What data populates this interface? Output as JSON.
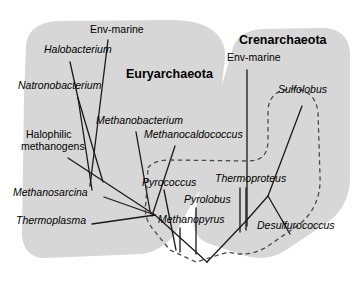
{
  "figure": {
    "domains": [
      {
        "id": "euryarchaeota",
        "label": "Euryarchaeota",
        "x": 126,
        "y": 78
      },
      {
        "id": "crenarchaeota",
        "label": "Crenarchaeota",
        "x": 239,
        "y": 44
      }
    ],
    "taxa": [
      {
        "id": "env-marine-eury",
        "label": "Env-marine",
        "x": 90,
        "y": 33,
        "style": "plain",
        "anchor": "start"
      },
      {
        "id": "halobacterium",
        "label": "Halobacterium",
        "x": 44,
        "y": 53,
        "style": "italic",
        "anchor": "start"
      },
      {
        "id": "natronobacterium",
        "label": "Natronobacterium",
        "x": 18,
        "y": 89,
        "style": "italic",
        "anchor": "start"
      },
      {
        "id": "halophilic-1",
        "label": "Halophilic",
        "x": 26,
        "y": 138,
        "style": "plain",
        "anchor": "start"
      },
      {
        "id": "halophilic-2",
        "label": "methanogens",
        "x": 21,
        "y": 150,
        "style": "plain",
        "anchor": "start"
      },
      {
        "id": "methanosarcina",
        "label": "Methanosarcina",
        "x": 13,
        "y": 196,
        "style": "italic",
        "anchor": "start"
      },
      {
        "id": "thermoplasma",
        "label": "Thermoplasma",
        "x": 16,
        "y": 224,
        "style": "italic",
        "anchor": "start"
      },
      {
        "id": "methanobacterium",
        "label": "Methanobacterium",
        "x": 96,
        "y": 124,
        "style": "italic",
        "anchor": "start"
      },
      {
        "id": "methanocaldococcus",
        "label": "Methanocaldococcus",
        "x": 144,
        "y": 138,
        "style": "italic",
        "anchor": "start"
      },
      {
        "id": "pyrococcus",
        "label": "Pyrococcus",
        "x": 142,
        "y": 186,
        "style": "italic",
        "anchor": "start"
      },
      {
        "id": "pyrolobus",
        "label": "Pyrolobus",
        "x": 184,
        "y": 203,
        "style": "italic",
        "anchor": "start"
      },
      {
        "id": "methanopyrus",
        "label": "Methanopyrus",
        "x": 158,
        "y": 223,
        "style": "italic",
        "anchor": "start"
      },
      {
        "id": "env-marine-cren",
        "label": "Env-marine",
        "x": 227,
        "y": 61,
        "style": "plain",
        "anchor": "start"
      },
      {
        "id": "sulfolobus",
        "label": "Sulfolobus",
        "x": 278,
        "y": 93,
        "style": "italic",
        "anchor": "start"
      },
      {
        "id": "thermoproteus",
        "label": "Thermoproteus",
        "x": 215,
        "y": 182,
        "style": "italic",
        "anchor": "start"
      },
      {
        "id": "desulfurococcus",
        "label": "Desulfurococcus",
        "x": 257,
        "y": 229,
        "style": "italic",
        "anchor": "start"
      }
    ],
    "colors": {
      "shaded_background": "#d7d7d7",
      "branch_line": "#1a1a1a",
      "hyperthermophile_boundary": "#4a4a4a",
      "page_background": "#ffffff"
    },
    "shapes": {
      "euryarchaeota_blob": "M 26,48 C 26,30 40,22 58,21 L 170,20 C 196,20 212,26 220,38 C 226,47 226,56 224,66 L 214,150 C 212,166 206,182 196,196 L 176,232 C 168,244 156,252 142,254 L 46,258 C 32,259 23,250 22,236 L 24,96 Z",
      "crenarchaeota_blob": "M 232,52 C 234,38 246,30 262,29 L 322,28 C 340,28 350,38 350,54 L 350,178 C 350,196 342,212 328,222 L 286,250 C 274,258 260,260 246,256 L 210,244 C 198,240 192,230 194,218 L 216,104 Z",
      "hyperthermophile_boundary": "M 148,168 C 152,162 160,160 172,160 L 248,161 C 262,161 268,154 268,140 L 268,112 C 268,98 276,90 290,89 C 306,88 316,96 318,112 L 320,176 C 321,196 314,212 300,224 L 268,246 C 256,254 242,256 228,252 L 196,262 L 170,250 L 152,228 C 146,220 144,212 146,202 Z"
    },
    "branches": [
      {
        "id": "root-to-left",
        "d": "M 207,262 L 155,215"
      },
      {
        "id": "root-to-right",
        "d": "M 207,262 L 246,221"
      },
      {
        "id": "thermoplasma-branch",
        "d": "M 92,224 L 155,215"
      },
      {
        "id": "methanosarcina-branch",
        "d": "M 104,197 L 155,215"
      },
      {
        "id": "halophile-stem",
        "d": "M 68,158 L 155,215"
      },
      {
        "id": "halophile-node-up",
        "d": "M 103,182 L 78,98"
      },
      {
        "id": "halobacterium-tip",
        "d": "M 78,98 L 70,62"
      },
      {
        "id": "natronobacterium-tip",
        "d": "M 78,98 L 92,190"
      },
      {
        "id": "env-marine-eury-tip",
        "d": "M 108,40 L 90,186"
      },
      {
        "id": "methanobacterium-tip",
        "d": "M 136,132 L 150,211"
      },
      {
        "id": "methanocaldococcus-tip",
        "d": "M 175,146 L 152,216"
      },
      {
        "id": "pyrococcus-tip",
        "d": "M 164,190 L 176,250"
      },
      {
        "id": "pyrolobus-tip",
        "d": "M 196,208 L 196,254"
      },
      {
        "id": "methanopyrus-tip",
        "d": "M 180,228 L 180,252"
      },
      {
        "id": "cren-internal",
        "d": "M 246,221 L 268,196"
      },
      {
        "id": "env-marine-cren-tip",
        "d": "M 247,70 L 247,226"
      },
      {
        "id": "thermoproteus-tip-a",
        "d": "M 240,188 L 240,232"
      },
      {
        "id": "thermoproteus-tip-b",
        "d": "M 246,188 L 246,230"
      },
      {
        "id": "sulfolobus-tip",
        "d": "M 302,106 L 268,196"
      },
      {
        "id": "desulfurococcus-tip",
        "d": "M 268,196 L 290,234"
      }
    ]
  }
}
